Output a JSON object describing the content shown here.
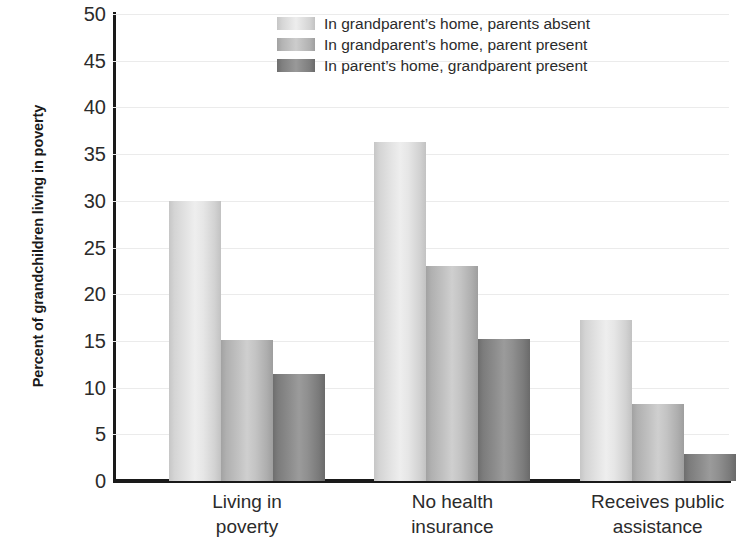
{
  "chart_data": {
    "type": "bar",
    "title": "",
    "subtitle": "",
    "xlabel": "",
    "ylabel": "Percent of grandchildren living in poverty",
    "ylim": [
      0,
      50
    ],
    "ytick_labels": [
      "0",
      "5",
      "10",
      "15",
      "20",
      "25",
      "30",
      "35",
      "40",
      "45",
      "50"
    ],
    "ytick_values": [
      0,
      5,
      10,
      15,
      20,
      25,
      30,
      35,
      40,
      45,
      50
    ],
    "grid": true,
    "grid_axis": "y",
    "legend_position": "top-right",
    "categories": [
      "Living in poverty",
      "No health insurance",
      "Receives public assistance"
    ],
    "category_lines": [
      [
        "Living in",
        "poverty"
      ],
      [
        "No health",
        "insurance"
      ],
      [
        "Receives public",
        "assistance"
      ]
    ],
    "series": [
      {
        "name": "In grandparent’s home, parents absent",
        "color": "#e4e4e4",
        "values": [
          30.0,
          36.3,
          17.2
        ]
      },
      {
        "name": "In grandparent’s home, parent present",
        "color": "#c2c2c2",
        "values": [
          15.1,
          23.0,
          8.2
        ]
      },
      {
        "name": "In parent’s home, grandparent present",
        "color": "#8e8e8e",
        "values": [
          11.5,
          15.2,
          2.9
        ]
      }
    ]
  },
  "legend": {
    "items": [
      {
        "label": "In grandparent’s home, parents absent"
      },
      {
        "label": "In grandparent’s home, parent present"
      },
      {
        "label": "In parent’s home, grandparent present"
      }
    ]
  }
}
